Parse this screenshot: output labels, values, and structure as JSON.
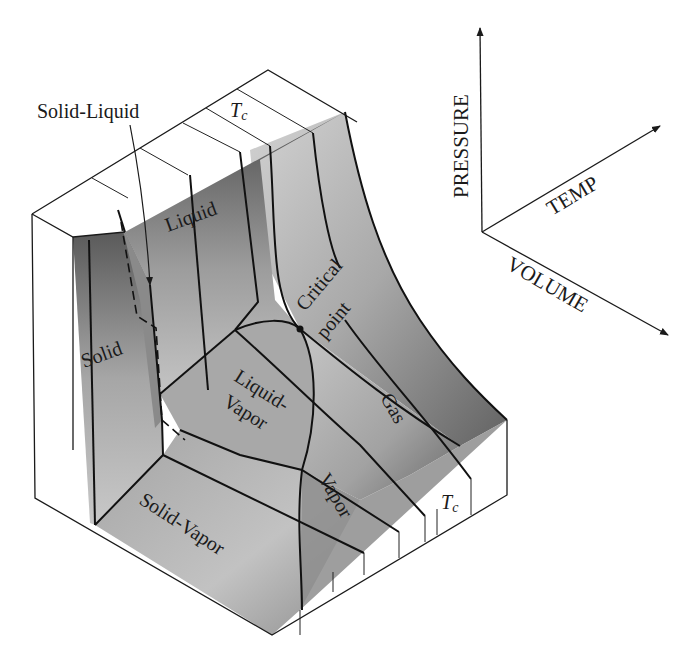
{
  "diagram": {
    "type": "3d-surface-diagram",
    "regions": {
      "solid": "Solid",
      "liquid": "Liquid",
      "gas": "Gas",
      "vapor": "Vapor",
      "solid_liquid": "Solid-Liquid",
      "liquid_vapor_line1": "Liquid-",
      "liquid_vapor_line2": "Vapor",
      "solid_vapor": "Solid-Vapor"
    },
    "points": {
      "critical_line1": "Critical",
      "critical_line2": "point"
    },
    "isotherm_labels": {
      "top": "T",
      "top_sub": "c",
      "bottom": "T",
      "bottom_sub": "c"
    },
    "axes": {
      "pressure": "PRESSURE",
      "temperature": "TEMP",
      "volume": "VOLUME"
    },
    "colors": {
      "ink": "#1a1a1a",
      "surface_dark": "#5e5e5e",
      "surface_mid": "#9a9a9a",
      "surface_light": "#c8c8c8",
      "paper": "#ffffff"
    }
  }
}
